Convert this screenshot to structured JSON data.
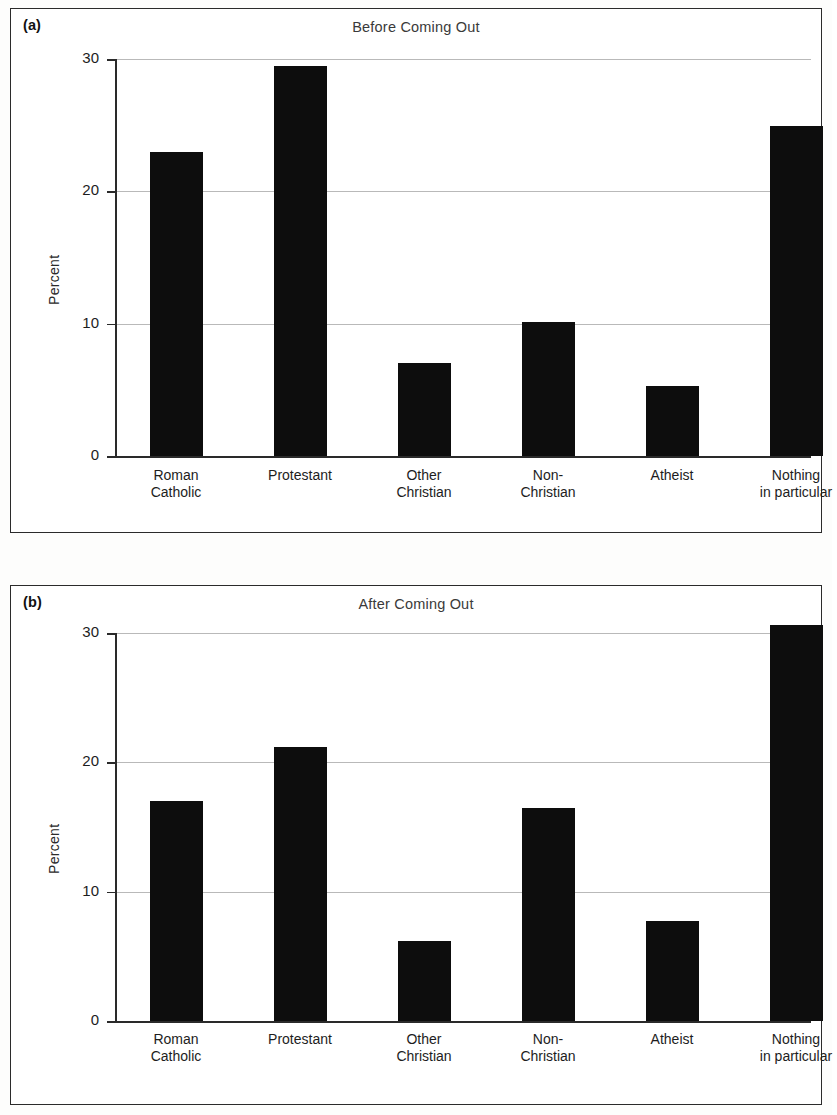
{
  "figure": {
    "background": "#fdfdfc",
    "bar_color": "#0d0d0d",
    "grid_color": "#b9b9b9",
    "axis_color": "#2a2a2a"
  },
  "panels": [
    {
      "panel_label": "(a)",
      "title": "Before Coming Out",
      "ylabel": "Percent",
      "ytick_labels": [
        "30",
        "20",
        "10",
        "0"
      ],
      "categories": [
        {
          "line1": "Roman",
          "line2": "Catholic"
        },
        {
          "line1": "Protestant",
          "line2": ""
        },
        {
          "line1": "Other",
          "line2": "Christian"
        },
        {
          "line1": "Non-",
          "line2": "Christian"
        },
        {
          "line1": "Atheist",
          "line2": ""
        },
        {
          "line1": "Nothing",
          "line2": "in particular"
        }
      ]
    },
    {
      "panel_label": "(b)",
      "title": "After Coming Out",
      "ylabel": "Percent",
      "ytick_labels": [
        "30",
        "20",
        "10",
        "0"
      ],
      "categories": [
        {
          "line1": "Roman",
          "line2": "Catholic"
        },
        {
          "line1": "Protestant",
          "line2": ""
        },
        {
          "line1": "Other",
          "line2": "Christian"
        },
        {
          "line1": "Non-",
          "line2": "Christian"
        },
        {
          "line1": "Atheist",
          "line2": ""
        },
        {
          "line1": "Nothing",
          "line2": "in particular"
        }
      ]
    }
  ],
  "chart_data": [
    {
      "type": "bar",
      "panel": "(a)",
      "title": "Before Coming Out",
      "xlabel": "",
      "ylabel": "Percent",
      "ylim": [
        0,
        30
      ],
      "yticks": [
        0,
        10,
        20,
        30
      ],
      "grid": true,
      "legend": false,
      "categories": [
        "Roman Catholic",
        "Protestant",
        "Other Christian",
        "Non-Christian",
        "Atheist",
        "Nothing in particular"
      ],
      "values": [
        23.0,
        29.5,
        7.0,
        10.1,
        5.3,
        24.9
      ]
    },
    {
      "type": "bar",
      "panel": "(b)",
      "title": "After Coming Out",
      "xlabel": "",
      "ylabel": "Percent",
      "ylim": [
        0,
        30
      ],
      "yticks": [
        0,
        10,
        20,
        30
      ],
      "grid": true,
      "legend": false,
      "categories": [
        "Roman Catholic",
        "Protestant",
        "Other Christian",
        "Non-Christian",
        "Atheist",
        "Nothing in particular"
      ],
      "values": [
        17.0,
        21.2,
        6.2,
        16.5,
        7.7,
        30.6
      ]
    }
  ]
}
